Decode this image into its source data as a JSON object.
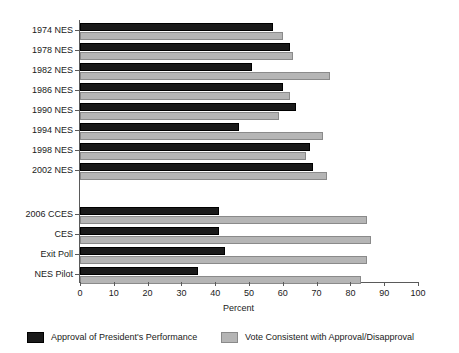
{
  "chart_data": {
    "type": "bar",
    "orientation": "horizontal",
    "title": "",
    "xlabel": "Percent",
    "ylabel": "",
    "xlim": [
      0,
      100
    ],
    "xticks": [
      0,
      10,
      20,
      30,
      40,
      50,
      60,
      70,
      80,
      90,
      100
    ],
    "grid": false,
    "legend_position": "bottom",
    "categories": [
      "1974 NES",
      "1978 NES",
      "1982 NES",
      "1986 NES",
      "1990 NES",
      "1994 NES",
      "1998 NES",
      "2002 NES",
      "2006 CCES",
      "CES",
      "Exit Poll",
      "NES Pilot"
    ],
    "group_break_after": "2002 NES",
    "series": [
      {
        "name": "Approval of President's Performance",
        "color": "#1a1a1a",
        "values": [
          57,
          62,
          51,
          60,
          64,
          47,
          68,
          69,
          41,
          41,
          43,
          35
        ]
      },
      {
        "name": "Vote Consistent with Approval/Disapproval",
        "color": "#b5b5b5",
        "values": [
          60,
          63,
          74,
          62,
          59,
          72,
          67,
          73,
          85,
          86,
          85,
          83
        ]
      }
    ]
  },
  "legend": {
    "items": [
      {
        "label": "Approval of President's Performance",
        "swatch": "dark-swatch"
      },
      {
        "label": "Vote Consistent with Approval/Disapproval",
        "swatch": "light-swatch"
      }
    ]
  }
}
